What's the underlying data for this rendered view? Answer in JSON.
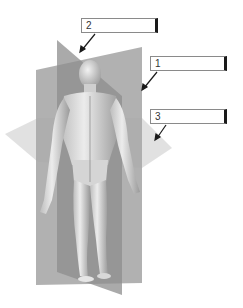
{
  "figure": {
    "labels": [
      {
        "number": "1",
        "answer": ""
      },
      {
        "number": "2",
        "answer": ""
      },
      {
        "number": "3",
        "answer": ""
      }
    ],
    "colors": {
      "background": "#ffffff",
      "frontal_plane": "#a9a9a9",
      "sagittal_plane": "#8c8c8c",
      "transverse_plane": "#d6d6d6",
      "body": "#d9d9d9",
      "label_border": "#8a8a8a",
      "arrow": "#1a1a1a"
    }
  }
}
